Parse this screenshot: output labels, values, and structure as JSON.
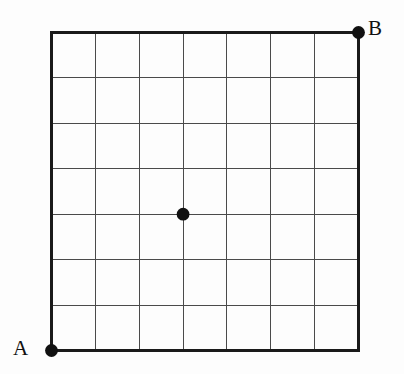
{
  "figure": {
    "kind": "lattice-grid-diagram",
    "background_color": "#fdfdfd",
    "ink_color": "#111111",
    "grid_line_color": "#4a4a4a",
    "border_color": "#1a1a1a"
  },
  "chart_data": {
    "type": "scatter",
    "title": "",
    "xlabel": "",
    "ylabel": "",
    "grid": true,
    "legend": false,
    "columns": 7,
    "rows": 7,
    "xlim": [
      0,
      7
    ],
    "ylim": [
      0,
      7
    ],
    "x_ticks": [
      0,
      1,
      2,
      3,
      4,
      5,
      6,
      7
    ],
    "y_ticks": [
      0,
      1,
      2,
      3,
      4,
      5,
      6,
      7
    ],
    "tick_labels_shown": false,
    "points": [
      {
        "label": "A",
        "x": 0,
        "y": 0,
        "label_position": "left"
      },
      {
        "label": "B",
        "x": 7,
        "y": 7,
        "label_position": "right"
      },
      {
        "label": "",
        "x": 3,
        "y": 3,
        "label_position": "none"
      }
    ]
  },
  "geometry": {
    "grid_left": 51.5,
    "grid_top": 32.5,
    "grid_right": 358.5,
    "grid_bottom": 350.5,
    "cell_width": 43.857,
    "cell_height": 45.429,
    "border_width": 2.4,
    "grid_line_width": 1.1,
    "dot_radius": 6.4
  },
  "labels": {
    "point_a": "A",
    "point_b": "B"
  }
}
